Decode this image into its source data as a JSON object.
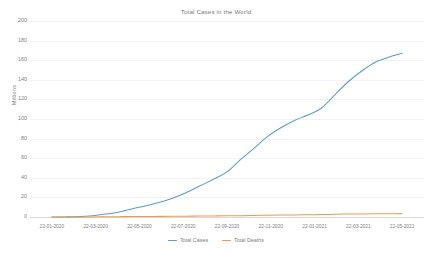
{
  "chart_data": {
    "type": "line",
    "title": "Total Cases in the World",
    "xlabel": "",
    "ylabel": "Millions",
    "ylim": [
      0,
      200
    ],
    "ytick_labels": [
      "200",
      "180",
      "160",
      "140",
      "120",
      "100",
      "80",
      "60",
      "40",
      "20",
      "0"
    ],
    "ytick_values": [
      200,
      180,
      160,
      140,
      120,
      100,
      80,
      60,
      40,
      20,
      0
    ],
    "grid": true,
    "legend_position": "bottom",
    "categories": [
      "22-01-2020",
      "22-03-2020",
      "22-05-2020",
      "22-07-2020",
      "22-09-2020",
      "22-11-2020",
      "22-01-2021",
      "22-03-2021",
      "22-05-2021"
    ],
    "x_tick_labels": [
      "22-01-2020",
      "22-03-2020",
      "22-05-2020",
      "22-07-2020",
      "22-09-2020",
      "22-11-2020",
      "22-01-2021",
      "22-03-2021",
      "22-05-2021"
    ],
    "series": [
      {
        "name": "Total Cases",
        "color": "#5b9bd5",
        "values": [
          0,
          0.4,
          5.2,
          15.0,
          31.8,
          58.5,
          98.5,
          124.5,
          167.0
        ],
        "dense_values": [
          0,
          0.1,
          0.4,
          1.3,
          3.0,
          5.2,
          8.5,
          11.5,
          15.0,
          19.5,
          25.0,
          31.8,
          38.5,
          46.0,
          58.5,
          70.0,
          82.0,
          91.0,
          98.5,
          104.0,
          111.0,
          124.5,
          138.0,
          149.0,
          158.0,
          163.0,
          167.0
        ]
      },
      {
        "name": "Total Deaths",
        "color": "#ed9b4a",
        "values": [
          0,
          0.02,
          0.33,
          0.62,
          0.97,
          1.38,
          2.12,
          2.74,
          3.46
        ],
        "dense_values": [
          0,
          0.01,
          0.02,
          0.1,
          0.22,
          0.33,
          0.45,
          0.54,
          0.62,
          0.72,
          0.84,
          0.97,
          1.1,
          1.22,
          1.38,
          1.58,
          1.82,
          1.99,
          2.12,
          2.28,
          2.45,
          2.74,
          2.98,
          3.15,
          3.3,
          3.39,
          3.46
        ]
      }
    ],
    "legend": [
      {
        "label": "Total Cases",
        "color": "#5b9bd5"
      },
      {
        "label": "Total Deaths",
        "color": "#ed9b4a"
      }
    ]
  }
}
